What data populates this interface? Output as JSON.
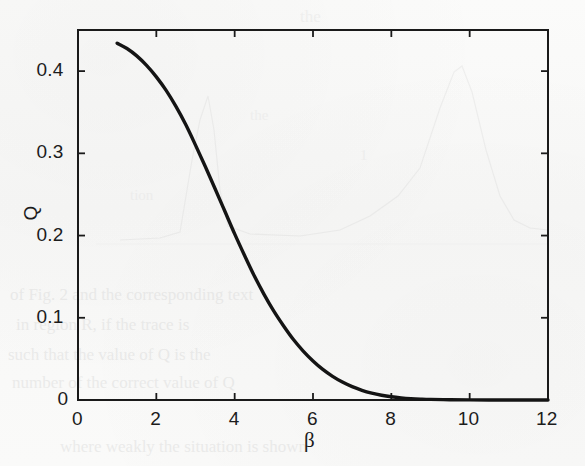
{
  "figure": {
    "background_color": "#fafaf9",
    "ink_color": "#1a1a1a",
    "medium": "scanned-journal-page"
  },
  "chart_data": {
    "type": "line",
    "title": "",
    "subtitle": "",
    "xlabel": "β",
    "ylabel": "Q",
    "xlim": [
      0,
      12
    ],
    "ylim": [
      0,
      0.45
    ],
    "xticks": [
      0,
      2,
      4,
      6,
      8,
      10,
      12
    ],
    "xtick_labels": [
      "0",
      "2",
      "4",
      "6",
      "8",
      "10",
      "12"
    ],
    "yticks": [
      0,
      0.1,
      0.2,
      0.3,
      0.4
    ],
    "ytick_labels": [
      "0",
      "0.1",
      "0.2",
      "0.3",
      "0.4"
    ],
    "grid": false,
    "legend": null,
    "legend_position": "none",
    "box": true,
    "tick_direction": "in",
    "series": [
      {
        "name": "Q",
        "color": "#141414",
        "line_width": 3.4,
        "marker": "none",
        "x": [
          1.0,
          1.25,
          1.5,
          1.75,
          2.0,
          2.25,
          2.5,
          2.75,
          3.0,
          3.25,
          3.5,
          3.75,
          4.0,
          4.25,
          4.5,
          4.75,
          5.0,
          5.25,
          5.5,
          5.75,
          6.0,
          6.25,
          6.5,
          6.75,
          7.0,
          7.25,
          7.5,
          7.75,
          8.0,
          8.25,
          8.5,
          8.75,
          9.0,
          9.5,
          10.0,
          10.5,
          11.0,
          11.5,
          12.0
        ],
        "y": [
          0.434,
          0.4275,
          0.4185,
          0.407,
          0.393,
          0.3765,
          0.357,
          0.335,
          0.31,
          0.284,
          0.257,
          0.2295,
          0.202,
          0.176,
          0.151,
          0.1285,
          0.108,
          0.09,
          0.0735,
          0.0595,
          0.0475,
          0.0372,
          0.0288,
          0.0218,
          0.0162,
          0.0118,
          0.0084,
          0.0058,
          0.0039,
          0.0026,
          0.0017,
          0.0011,
          0.0007,
          0.0003,
          0.0001,
          0.0,
          0.0,
          0.0,
          0.0
        ]
      }
    ],
    "annotations": []
  },
  "axes_pixels": {
    "left": 78,
    "right": 548,
    "top": 30,
    "bottom": 400
  },
  "bleedthrough": {
    "description": "faint reversed text and a ghost plot showing through from the other side of the scanned page",
    "lines": [
      "of Fig. 2 and the corresponding text",
      "in region R, if the trace is",
      "such that the value of Q is the",
      "number of the correct value of Q",
      "where weakly the situation is shown"
    ]
  }
}
